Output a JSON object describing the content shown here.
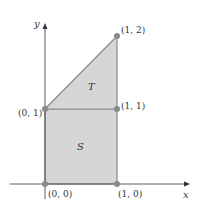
{
  "figure": {
    "axes": {
      "x_label": "x",
      "y_label": "y"
    },
    "regions": [
      {
        "name": "S",
        "label": "S",
        "description": "unit square",
        "vertices": [
          [
            0,
            0
          ],
          [
            1,
            0
          ],
          [
            1,
            1
          ],
          [
            0,
            1
          ]
        ]
      },
      {
        "name": "T",
        "label": "T",
        "description": "triangle",
        "vertices": [
          [
            0,
            1
          ],
          [
            1,
            1
          ],
          [
            1,
            2
          ]
        ]
      }
    ],
    "points": [
      {
        "label": "(0, 0)",
        "x": 0,
        "y": 0
      },
      {
        "label": "(1, 0)",
        "x": 1,
        "y": 0
      },
      {
        "label": "(0, 1)",
        "x": 0,
        "y": 1
      },
      {
        "label": "(1, 1)",
        "x": 1,
        "y": 1
      },
      {
        "label": "(1, 2)",
        "x": 1,
        "y": 2
      }
    ],
    "colors": {
      "fill": "#d6d6d6",
      "edge": "#8a8a8a",
      "point": "#8a8a8a",
      "axis": "#333333"
    }
  }
}
